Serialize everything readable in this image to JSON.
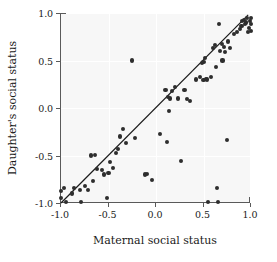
{
  "chart_data": {
    "type": "scatter",
    "title": "",
    "xlabel": "Maternal social status",
    "ylabel": "Daughter's social status",
    "xlim": [
      -1.0,
      1.0
    ],
    "ylim": [
      -1.0,
      1.0
    ],
    "xticks": [
      -1.0,
      -0.5,
      0.0,
      0.5,
      1.0
    ],
    "yticks": [
      -1.0,
      -0.5,
      0.0,
      0.5,
      1.0
    ],
    "xticklabels": [
      "-1.0",
      "-0.5",
      "0.0",
      "0.5",
      "1.0"
    ],
    "yticklabels": [
      "-1.0",
      "-0.5",
      "0.0",
      "0.5",
      "1.0"
    ],
    "grid": true,
    "grid_color": "#ffffff",
    "plot_background": "#f7f7f7",
    "marker_color": "#2e2e2e",
    "marker_size": 4,
    "legend": null,
    "fit_line": {
      "label": "regression line",
      "color": "#1a1a1a",
      "x_start": -1.0,
      "y_start": -1.0,
      "x_end": 0.97,
      "y_end": 0.98
    },
    "points": [
      [
        -1.0,
        -0.87
      ],
      [
        -1.0,
        -0.95
      ],
      [
        -0.97,
        -0.84
      ],
      [
        -0.95,
        -0.99
      ],
      [
        -0.88,
        -0.9
      ],
      [
        -0.86,
        -0.84
      ],
      [
        -0.8,
        -0.86
      ],
      [
        -0.79,
        -0.99
      ],
      [
        -0.75,
        -0.82
      ],
      [
        -0.72,
        -0.86
      ],
      [
        -0.68,
        -0.5
      ],
      [
        -0.66,
        -0.77
      ],
      [
        -0.64,
        -0.49
      ],
      [
        -0.62,
        -0.64
      ],
      [
        -0.57,
        -0.65
      ],
      [
        -0.55,
        -0.7
      ],
      [
        -0.52,
        -0.95
      ],
      [
        -0.5,
        -0.68
      ],
      [
        -0.48,
        -0.57
      ],
      [
        -0.45,
        -0.63
      ],
      [
        -0.42,
        -0.47
      ],
      [
        -0.4,
        -0.43
      ],
      [
        -0.38,
        -0.3
      ],
      [
        -0.35,
        -0.22
      ],
      [
        -0.32,
        -0.37
      ],
      [
        -0.25,
        0.5
      ],
      [
        -0.22,
        -0.32
      ],
      [
        -0.12,
        -0.7
      ],
      [
        -0.09,
        -0.69
      ],
      [
        -0.04,
        -0.76
      ],
      [
        0.04,
        -0.27
      ],
      [
        0.1,
        0.19
      ],
      [
        0.12,
        -0.36
      ],
      [
        0.13,
        0.12
      ],
      [
        0.14,
        -0.03
      ],
      [
        0.15,
        0.1
      ],
      [
        0.17,
        0.18
      ],
      [
        0.2,
        0.22
      ],
      [
        0.23,
        0.1
      ],
      [
        0.26,
        -0.56
      ],
      [
        0.3,
        0.19
      ],
      [
        0.33,
        0.09
      ],
      [
        0.36,
        0.07
      ],
      [
        0.42,
        0.3
      ],
      [
        0.46,
        0.33
      ],
      [
        0.48,
        0.47
      ],
      [
        0.5,
        0.48
      ],
      [
        0.5,
        0.29
      ],
      [
        0.52,
        0.53
      ],
      [
        0.53,
        0.31
      ],
      [
        0.54,
        0.3
      ],
      [
        0.55,
        -0.99
      ],
      [
        0.58,
        0.33
      ],
      [
        0.6,
        0.63
      ],
      [
        0.62,
        0.66
      ],
      [
        0.63,
        0.43
      ],
      [
        0.64,
        -0.84
      ],
      [
        0.65,
        -0.99
      ],
      [
        0.66,
        0.88
      ],
      [
        0.67,
        0.6
      ],
      [
        0.69,
        0.67
      ],
      [
        0.7,
        0.5
      ],
      [
        0.72,
        0.64
      ],
      [
        0.73,
        0.59
      ],
      [
        0.75,
        -0.34
      ],
      [
        0.76,
        0.7
      ],
      [
        0.78,
        0.63
      ],
      [
        0.82,
        0.78
      ],
      [
        0.85,
        0.8
      ],
      [
        0.88,
        0.83
      ],
      [
        0.9,
        0.86
      ],
      [
        0.91,
        0.92
      ],
      [
        0.93,
        0.93
      ],
      [
        0.94,
        0.88
      ],
      [
        0.95,
        0.9
      ],
      [
        0.96,
        0.95
      ],
      [
        0.97,
        0.8
      ],
      [
        0.98,
        0.84
      ],
      [
        0.99,
        0.92
      ],
      [
        1.0,
        0.95
      ],
      [
        1.0,
        0.88
      ],
      [
        1.0,
        0.81
      ]
    ]
  }
}
